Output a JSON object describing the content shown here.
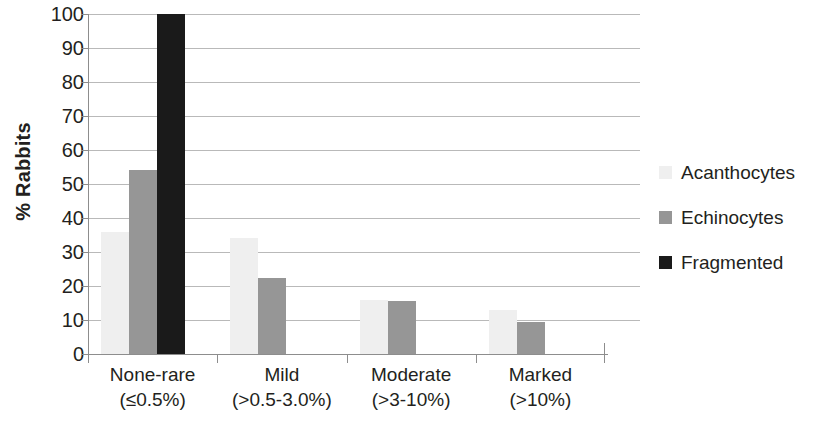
{
  "chart_data": {
    "type": "bar",
    "title": "",
    "subtitle": "",
    "xlabel": "",
    "ylabel": "% Rabbits",
    "ylim": [
      0,
      100
    ],
    "ytick_step": 10,
    "yticks": [
      0,
      10,
      20,
      30,
      40,
      50,
      60,
      70,
      80,
      90,
      100
    ],
    "ytick_labels": [
      "0",
      "10",
      "20",
      "30",
      "40",
      "50",
      "60",
      "70",
      "80",
      "90",
      "100"
    ],
    "grid": "horizontal",
    "legend_position": "right",
    "categories": [
      "None-rare (≤0.5%)",
      "Mild (>0.5-3.0%)",
      "Moderate (>3-10%)",
      "Marked (>10%)"
    ],
    "category_lines": [
      [
        "None-rare",
        "(≤0.5%)"
      ],
      [
        "Mild",
        "(>0.5-3.0%)"
      ],
      [
        "Moderate",
        "(>3-10%)"
      ],
      [
        "Marked",
        "(>10%)"
      ]
    ],
    "series": [
      {
        "name": "Acanthocytes",
        "color": "#efefef",
        "values": [
          36,
          34,
          16,
          13
        ]
      },
      {
        "name": "Echinocytes",
        "color": "#969696",
        "values": [
          54,
          22.5,
          15.5,
          9.5
        ]
      },
      {
        "name": "Fragmented",
        "color": "#1a1a1a",
        "values": [
          100,
          0,
          0,
          0
        ]
      }
    ]
  },
  "legend": {
    "items": [
      {
        "label": "Acanthocytes",
        "color": "#efefef"
      },
      {
        "label": "Echinocytes",
        "color": "#969696"
      },
      {
        "label": "Fragmented",
        "color": "#1a1a1a"
      }
    ]
  },
  "colors": {
    "gridline": "#b9b9b9",
    "axis": "#8d8d8d",
    "text": "#231f20",
    "background": "#ffffff"
  }
}
